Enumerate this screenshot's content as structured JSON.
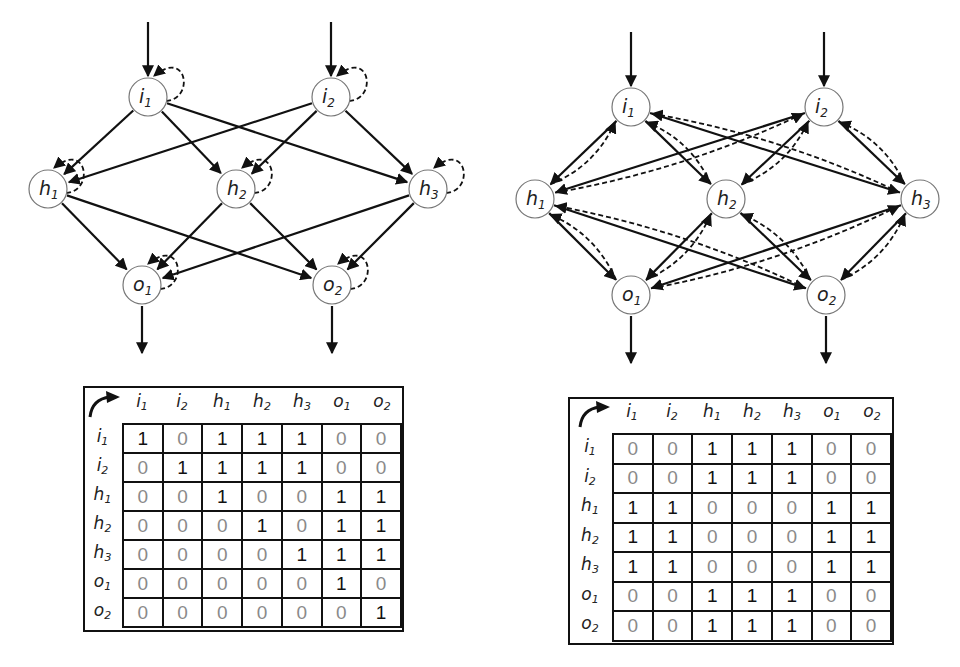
{
  "figure": {
    "left_panel": {
      "title": "Feedforward network with self-recurrent (dashed) connections",
      "nodes": [
        {
          "id": "i1",
          "base": "i",
          "sub": "1",
          "x": 148,
          "y": 97
        },
        {
          "id": "i2",
          "base": "i",
          "sub": "2",
          "x": 331,
          "y": 97
        },
        {
          "id": "h1",
          "base": "h",
          "sub": "1",
          "x": 48,
          "y": 189
        },
        {
          "id": "h2",
          "base": "h",
          "sub": "2",
          "x": 236,
          "y": 189
        },
        {
          "id": "h3",
          "base": "h",
          "sub": "3",
          "x": 428,
          "y": 189
        },
        {
          "id": "o1",
          "base": "o",
          "sub": "1",
          "x": 142,
          "y": 285
        },
        {
          "id": "o2",
          "base": "o",
          "sub": "2",
          "x": 332,
          "y": 285
        }
      ],
      "solid_edges": [
        [
          "i1",
          "h1"
        ],
        [
          "i1",
          "h2"
        ],
        [
          "i1",
          "h3"
        ],
        [
          "i2",
          "h1"
        ],
        [
          "i2",
          "h2"
        ],
        [
          "i2",
          "h3"
        ],
        [
          "h1",
          "o1"
        ],
        [
          "h1",
          "o2"
        ],
        [
          "h2",
          "o1"
        ],
        [
          "h2",
          "o2"
        ],
        [
          "h3",
          "o1"
        ],
        [
          "h3",
          "o2"
        ]
      ],
      "self_loops": [
        "i1",
        "i2",
        "h1",
        "h2",
        "h3",
        "o1",
        "o2"
      ],
      "inputs": [
        "i1",
        "i2"
      ],
      "outputs": [
        "o1",
        "o2"
      ]
    },
    "right_panel": {
      "title": "Network with bidirectional (dashed) feedback connections",
      "nodes": [
        {
          "id": "i1",
          "base": "i",
          "sub": "1",
          "x": 631,
          "y": 107
        },
        {
          "id": "i2",
          "base": "i",
          "sub": "2",
          "x": 824,
          "y": 107
        },
        {
          "id": "h1",
          "base": "h",
          "sub": "1",
          "x": 535,
          "y": 199
        },
        {
          "id": "h2",
          "base": "h",
          "sub": "2",
          "x": 726,
          "y": 199
        },
        {
          "id": "h3",
          "base": "h",
          "sub": "3",
          "x": 920,
          "y": 199
        },
        {
          "id": "o1",
          "base": "o",
          "sub": "1",
          "x": 631,
          "y": 295
        },
        {
          "id": "o2",
          "base": "o",
          "sub": "2",
          "x": 826,
          "y": 295
        }
      ],
      "solid_edges": [
        [
          "i1",
          "h1"
        ],
        [
          "i1",
          "h2"
        ],
        [
          "i1",
          "h3"
        ],
        [
          "i2",
          "h1"
        ],
        [
          "i2",
          "h2"
        ],
        [
          "i2",
          "h3"
        ],
        [
          "h1",
          "o1"
        ],
        [
          "h1",
          "o2"
        ],
        [
          "h2",
          "o1"
        ],
        [
          "h2",
          "o2"
        ],
        [
          "h3",
          "o1"
        ],
        [
          "h3",
          "o2"
        ]
      ],
      "dashed_feedback_edges": [
        [
          "h1",
          "i1"
        ],
        [
          "h1",
          "i2"
        ],
        [
          "h2",
          "i1"
        ],
        [
          "h2",
          "i2"
        ],
        [
          "h3",
          "i1"
        ],
        [
          "h3",
          "i2"
        ],
        [
          "o1",
          "h1"
        ],
        [
          "o1",
          "h2"
        ],
        [
          "o1",
          "h3"
        ],
        [
          "o2",
          "h1"
        ],
        [
          "o2",
          "h2"
        ],
        [
          "o2",
          "h3"
        ]
      ],
      "inputs": [
        "i1",
        "i2"
      ],
      "outputs": [
        "o1",
        "o2"
      ]
    }
  },
  "matrices": {
    "left": {
      "col_headers": [
        {
          "b": "i",
          "s": "1"
        },
        {
          "b": "i",
          "s": "2"
        },
        {
          "b": "h",
          "s": "1"
        },
        {
          "b": "h",
          "s": "2"
        },
        {
          "b": "h",
          "s": "3"
        },
        {
          "b": "o",
          "s": "1"
        },
        {
          "b": "o",
          "s": "2"
        }
      ],
      "row_headers": [
        {
          "b": "i",
          "s": "1"
        },
        {
          "b": "i",
          "s": "2"
        },
        {
          "b": "h",
          "s": "1"
        },
        {
          "b": "h",
          "s": "2"
        },
        {
          "b": "h",
          "s": "3"
        },
        {
          "b": "o",
          "s": "1"
        },
        {
          "b": "o",
          "s": "2"
        }
      ],
      "rows": [
        [
          1,
          0,
          1,
          1,
          1,
          0,
          0
        ],
        [
          0,
          1,
          1,
          1,
          1,
          0,
          0
        ],
        [
          0,
          0,
          1,
          0,
          0,
          1,
          1
        ],
        [
          0,
          0,
          0,
          1,
          0,
          1,
          1
        ],
        [
          0,
          0,
          0,
          0,
          1,
          1,
          1
        ],
        [
          0,
          0,
          0,
          0,
          0,
          1,
          0
        ],
        [
          0,
          0,
          0,
          0,
          0,
          0,
          1
        ]
      ]
    },
    "right": {
      "col_headers": [
        {
          "b": "i",
          "s": "1"
        },
        {
          "b": "i",
          "s": "2"
        },
        {
          "b": "h",
          "s": "1"
        },
        {
          "b": "h",
          "s": "2"
        },
        {
          "b": "h",
          "s": "3"
        },
        {
          "b": "o",
          "s": "1"
        },
        {
          "b": "o",
          "s": "2"
        }
      ],
      "row_headers": [
        {
          "b": "i",
          "s": "1"
        },
        {
          "b": "i",
          "s": "2"
        },
        {
          "b": "h",
          "s": "1"
        },
        {
          "b": "h",
          "s": "2"
        },
        {
          "b": "h",
          "s": "3"
        },
        {
          "b": "o",
          "s": "1"
        },
        {
          "b": "o",
          "s": "2"
        }
      ],
      "rows": [
        [
          0,
          0,
          1,
          1,
          1,
          0,
          0
        ],
        [
          0,
          0,
          1,
          1,
          1,
          0,
          0
        ],
        [
          1,
          1,
          0,
          0,
          0,
          1,
          1
        ],
        [
          1,
          1,
          0,
          0,
          0,
          1,
          1
        ],
        [
          1,
          1,
          0,
          0,
          0,
          1,
          1
        ],
        [
          0,
          0,
          1,
          1,
          1,
          0,
          0
        ],
        [
          0,
          0,
          1,
          1,
          1,
          0,
          0
        ]
      ]
    }
  },
  "colors": {
    "edge": "#111111",
    "node_stroke": "#777777",
    "one_text": "#111111",
    "zero_text": "#8a8a8a"
  }
}
